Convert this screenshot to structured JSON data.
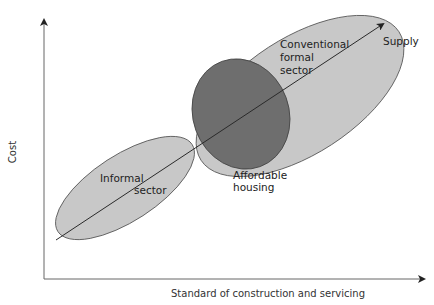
{
  "diagram": {
    "axes": {
      "y_label": "Cost",
      "x_label": "Standard of construction and servicing"
    },
    "supply_line": {
      "label": "Supply"
    },
    "regions": [
      {
        "id": "informal",
        "label_line1": "Informal",
        "label_line2": "sector",
        "fill": "#c8c8c8"
      },
      {
        "id": "conventional",
        "label_line1": "Conventional",
        "label_line2": "formal",
        "label_line3": "sector",
        "fill": "#c8c8c8"
      },
      {
        "id": "affordable",
        "label_line1": "Affordable",
        "label_line2": "housing",
        "fill": "#6e6e6e"
      }
    ],
    "colors": {
      "light_fill": "#c8c8c8",
      "dark_fill": "#6e6e6e",
      "outline": "#555555",
      "axis": "#555555",
      "line": "#333333"
    }
  }
}
